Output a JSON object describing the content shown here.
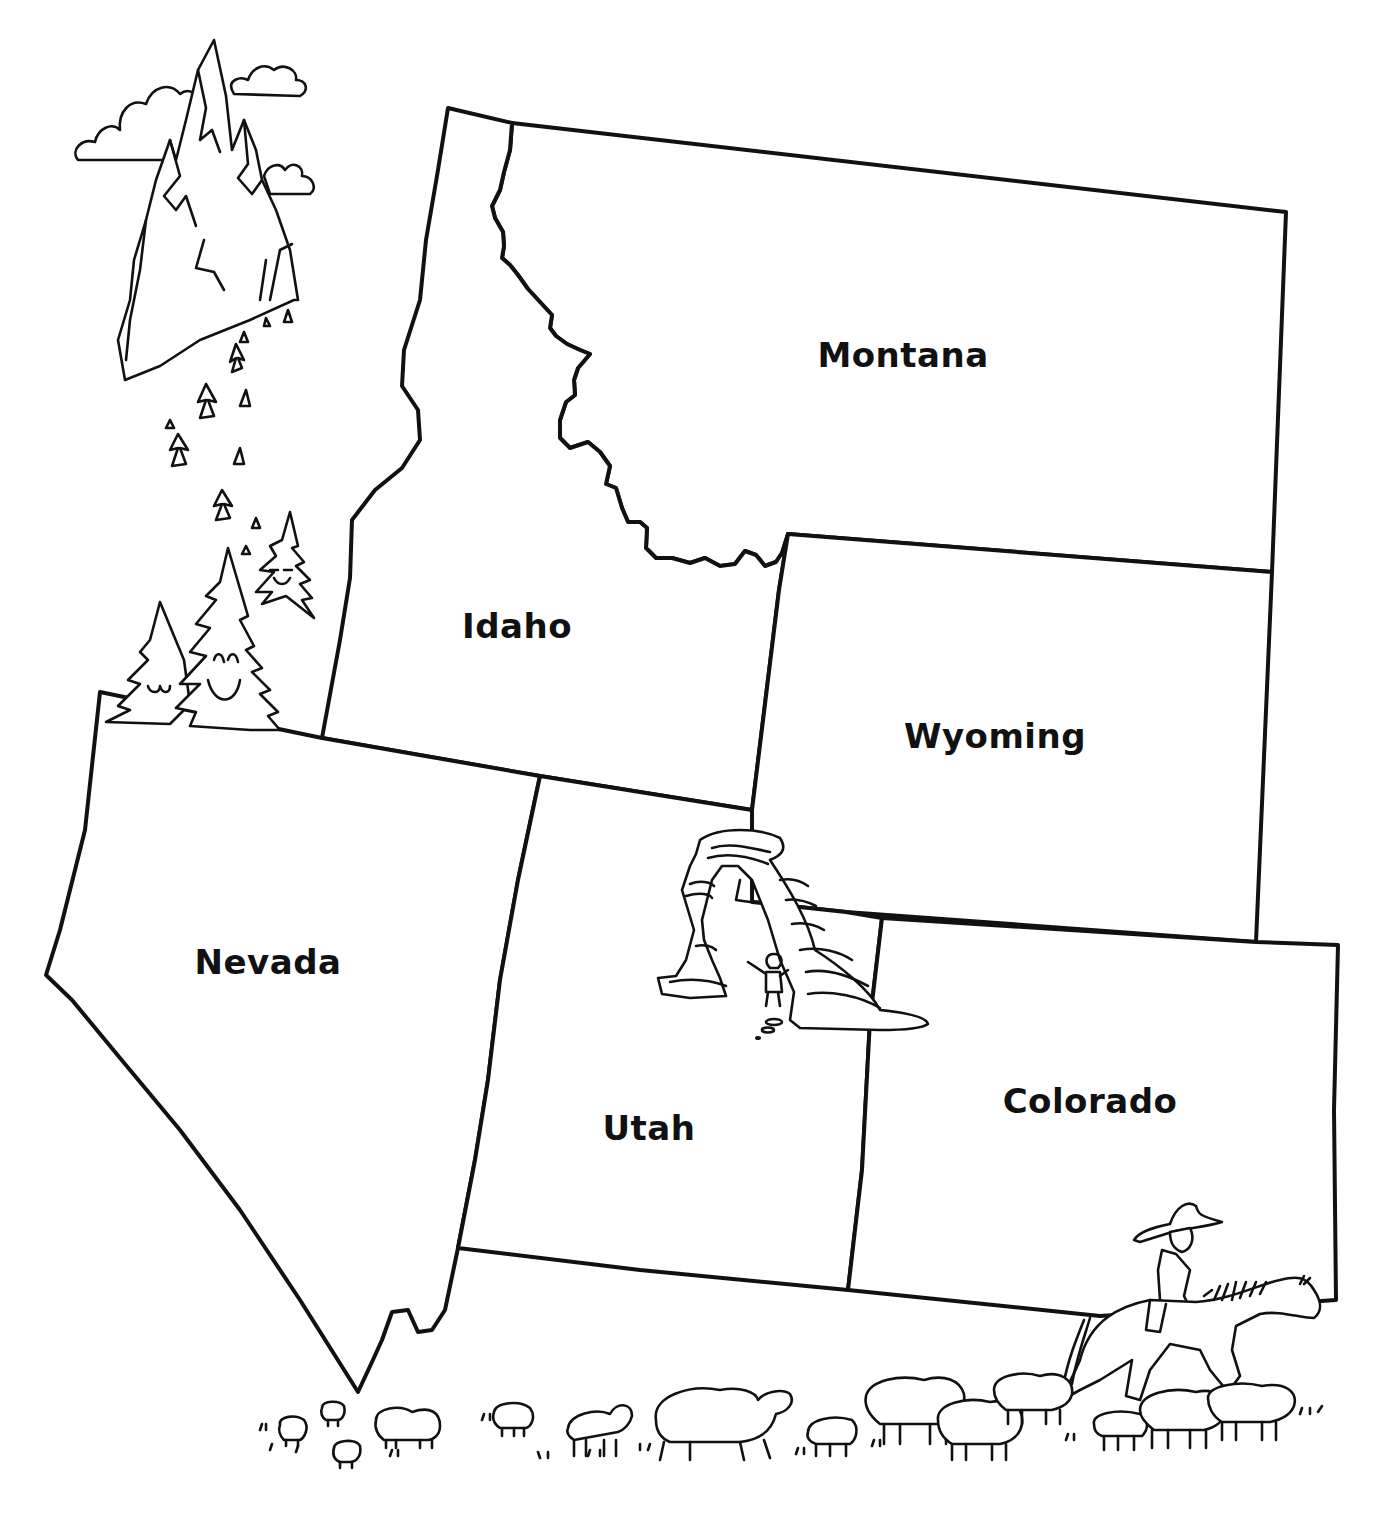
{
  "map": {
    "type": "outline map",
    "region": "Mountain West, United States",
    "style": "hand-drawn black ink on white",
    "colors": {
      "ink": "#111111",
      "background": "#ffffff"
    },
    "states": [
      {
        "id": "montana",
        "label": "Montana",
        "label_pos": [
          903,
          355
        ]
      },
      {
        "id": "idaho",
        "label": "Idaho",
        "label_pos": [
          517,
          626
        ]
      },
      {
        "id": "wyoming",
        "label": "Wyoming",
        "label_pos": [
          995,
          736
        ]
      },
      {
        "id": "nevada",
        "label": "Nevada",
        "label_pos": [
          268,
          962
        ]
      },
      {
        "id": "utah",
        "label": "Utah",
        "label_pos": [
          649,
          1128
        ]
      },
      {
        "id": "colorado",
        "label": "Colorado",
        "label_pos": [
          1090,
          1101
        ]
      }
    ],
    "illustrations": [
      {
        "name": "mountain-peaks-with-clouds",
        "near": "top-left"
      },
      {
        "name": "smiling-pine-trees",
        "near": "northern Nevada / western Idaho border"
      },
      {
        "name": "delicate-arch-with-child",
        "near": "eastern Utah"
      },
      {
        "name": "cowboy-on-horse",
        "near": "southern Colorado"
      },
      {
        "name": "flock-of-sheep",
        "near": "bottom edge"
      }
    ]
  }
}
